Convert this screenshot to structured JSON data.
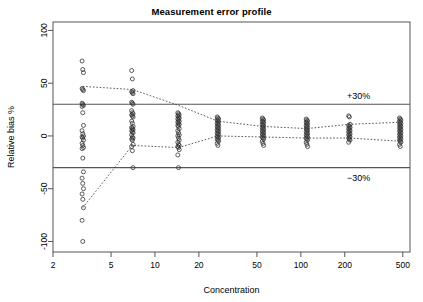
{
  "chart_data": {
    "type": "scatter",
    "title": "Measurement error profile",
    "xlabel": "Concentration",
    "ylabel": "Relative bias %",
    "xscale": "log",
    "xlim": [
      2,
      560
    ],
    "ylim": [
      -110,
      108
    ],
    "xticks": [
      2,
      5,
      10,
      20,
      50,
      100,
      200,
      500
    ],
    "xtick_labels": [
      "2",
      "5",
      "10",
      "20",
      "50",
      "100",
      "200",
      "500"
    ],
    "yticks": [
      -100,
      -50,
      0,
      50,
      100
    ],
    "ytick_labels": [
      "-100",
      "-50",
      "0",
      "50",
      "100"
    ],
    "grid": false,
    "legend": false,
    "acceptance_limits": {
      "upper": 30,
      "lower": -30,
      "upper_label": "+30%",
      "lower_label": "−30%",
      "line_color": "#555555"
    },
    "tolerance_interval_style": "dotted",
    "marker": "open-circle",
    "marker_color": "#333333",
    "levels": [
      3.2,
      7,
      14.5,
      27,
      55,
      110,
      215,
      480
    ],
    "series": [
      {
        "name": "Upper tolerance limit",
        "style": "dotted",
        "x": [
          3.2,
          7,
          14.5,
          27,
          55,
          110,
          215,
          480
        ],
        "values": [
          47,
          44,
          29,
          14,
          9,
          7,
          11,
          13
        ]
      },
      {
        "name": "Lower tolerance limit",
        "style": "dotted",
        "x": [
          3.2,
          7,
          14.5,
          27,
          55,
          110,
          215,
          480
        ],
        "values": [
          -68,
          -9,
          -11,
          0,
          -1,
          -2,
          -2,
          -5
        ]
      }
    ],
    "points": [
      {
        "x": 3.2,
        "y": [
          71,
          63,
          60,
          45,
          44,
          43,
          31,
          30,
          29,
          28,
          22,
          10,
          5,
          2,
          0,
          -1,
          -2,
          -4,
          -7,
          -9,
          -11,
          -12,
          -21,
          -34,
          -40,
          -45,
          -50,
          -55,
          -60,
          -68,
          -80,
          -100
        ]
      },
      {
        "x": 7,
        "y": [
          62,
          54,
          43,
          42,
          41,
          40,
          32,
          31,
          30,
          24,
          22,
          21,
          20,
          19,
          18,
          14,
          12,
          9,
          8,
          7,
          6,
          5,
          4,
          3,
          1,
          -1,
          -2,
          -3,
          -4,
          -8,
          -10,
          -14,
          -30
        ]
      },
      {
        "x": 14.5,
        "y": [
          22,
          21,
          20,
          19,
          18,
          17,
          16,
          15,
          14,
          13,
          12,
          11,
          10,
          9,
          7,
          5,
          3,
          1,
          0,
          -2,
          -4,
          -6,
          -8,
          -9,
          -10,
          -11,
          -13,
          -18,
          -30
        ]
      },
      {
        "x": 27,
        "y": [
          18,
          17,
          16,
          15,
          14,
          13,
          12,
          11,
          10,
          9,
          8,
          7,
          6,
          5,
          4,
          3,
          2,
          1,
          0,
          -1,
          -2,
          -3,
          -4,
          -5,
          -7,
          -9
        ]
      },
      {
        "x": 55,
        "y": [
          17,
          16,
          15,
          14,
          13,
          12,
          11,
          10,
          9,
          8,
          7,
          6,
          5,
          4,
          3,
          2,
          1,
          0,
          -1,
          -2,
          -3,
          -5,
          -7,
          -9
        ]
      },
      {
        "x": 110,
        "y": [
          16,
          15,
          14,
          13,
          12,
          11,
          10,
          9,
          8,
          7,
          6,
          5,
          4,
          3,
          2,
          1,
          0,
          -1,
          -2,
          -3,
          -4,
          -6,
          -8,
          -10
        ]
      },
      {
        "x": 215,
        "y": [
          19,
          18,
          11,
          10,
          9,
          8,
          7,
          6,
          5,
          4,
          3,
          2,
          1,
          0,
          -1,
          -2,
          -3,
          -4,
          -6
        ]
      },
      {
        "x": 480,
        "y": [
          17,
          16,
          15,
          14,
          13,
          12,
          11,
          10,
          9,
          8,
          7,
          6,
          5,
          4,
          3,
          2,
          1,
          0,
          -1,
          -2,
          -3,
          -4,
          -5,
          -6,
          -8,
          -10
        ]
      }
    ]
  }
}
